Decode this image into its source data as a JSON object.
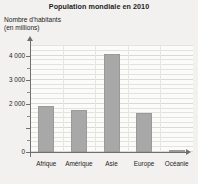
{
  "chart_data": {
    "type": "bar",
    "title": "Population mondiale en 2010",
    "ylabel": "Nombre d'habitants\n(en millions)",
    "xlabel": "",
    "categories": [
      "Afrique",
      "Amérique",
      "Asie",
      "Europe",
      "Océanie"
    ],
    "values": [
      1900,
      1750,
      4050,
      1600,
      60
    ],
    "ylim": [
      0,
      4400
    ],
    "yticks": [
      0,
      1000,
      2000,
      3000,
      4000
    ],
    "ytick_labels": [
      "0",
      "",
      "2 000",
      "3 000",
      "4 000"
    ],
    "ytick_minor": [
      500,
      1500,
      2500,
      3500
    ],
    "grid": true,
    "legend": "none",
    "bar_color": "#a8a8a8",
    "axis_color": "#6f6f6f",
    "background_color": "#f2f1ef",
    "plot_background_color": "#fbfbfa"
  }
}
